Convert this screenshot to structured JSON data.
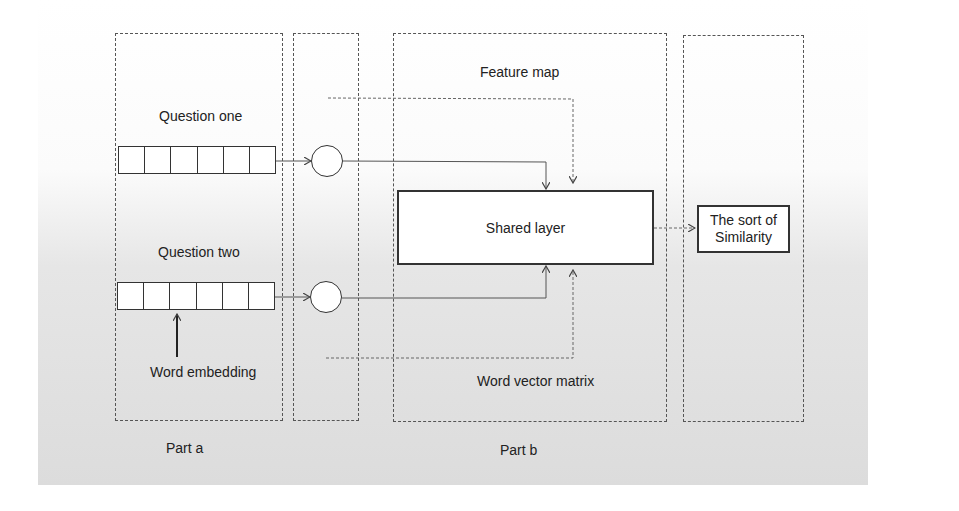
{
  "diagram": {
    "part_a": {
      "label": "Part a",
      "question_one": "Question one",
      "question_two": "Question two",
      "embedding_label": "Word embedding",
      "cells_per_question": 6
    },
    "part_b": {
      "label": "Part b",
      "top_label": "Feature map",
      "bottom_label": "Word vector matrix",
      "shared_layer": "Shared layer"
    },
    "output": {
      "line1": "The sort of",
      "line2": "Similarity"
    },
    "colors": {
      "line": "#333333",
      "dashed": "#555555",
      "background_top": "#ffffff",
      "background_bottom": "#dcdcdc"
    }
  }
}
